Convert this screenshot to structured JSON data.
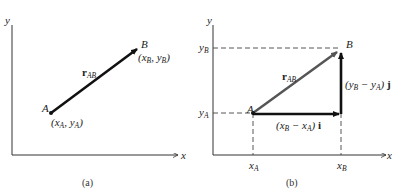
{
  "figure_a": {
    "caption": "(a)",
    "axis_x": "x",
    "axis_y": "y",
    "point_a": "A",
    "point_b": "B",
    "coord_a": {
      "x": "x",
      "xs": "A",
      "y": "y",
      "ys": "A"
    },
    "coord_b": {
      "x": "x",
      "xs": "B",
      "y": "y",
      "ys": "B"
    },
    "vector": {
      "main": "r",
      "sub": "AB"
    }
  },
  "figure_b": {
    "caption": "(b)",
    "axis_x": "x",
    "axis_y": "y",
    "point_a": "A",
    "point_b": "B",
    "tick_xa": {
      "main": "x",
      "sub": "A"
    },
    "tick_xb": {
      "main": "x",
      "sub": "B"
    },
    "tick_ya": {
      "main": "y",
      "sub": "A"
    },
    "tick_yb": {
      "main": "y",
      "sub": "B"
    },
    "vector": {
      "main": "r",
      "sub": "AB"
    },
    "horizontal_component": {
      "open": "(x",
      "s1": "B",
      "mid": " − x",
      "s2": "A",
      "close": ") ",
      "unit": "i"
    },
    "vertical_component": {
      "open": "(y",
      "s1": "B",
      "mid": " − y",
      "s2": "A",
      "close": ") ",
      "unit": "j"
    }
  },
  "colors": {
    "line": "#111111",
    "vector_diag_b": "#555555",
    "dashed": "#444444"
  }
}
